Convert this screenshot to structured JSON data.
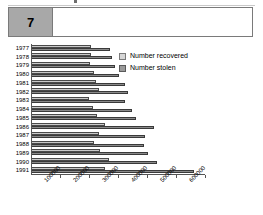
{
  "header": {
    "number": "7",
    "title": ""
  },
  "legend": {
    "position": "inside-top-right",
    "items": [
      {
        "label": "Number recovered",
        "key": "recovered",
        "color": "#d6d6d6"
      },
      {
        "label": "Number stolen",
        "key": "stolen",
        "color": "#9a9a9a"
      }
    ]
  },
  "chart_data": {
    "type": "bar",
    "orientation": "horizontal",
    "title": "",
    "xlabel": "",
    "ylabel": "",
    "grid": false,
    "xlim": [
      0,
      600000
    ],
    "xticks": [
      100000,
      200000,
      300000,
      400000,
      500000,
      600000
    ],
    "xtick_labels": [
      "100000",
      "200000",
      "300000",
      "400000",
      "500000",
      "600000"
    ],
    "categories": [
      "1977",
      "1978",
      "1979",
      "1980",
      "1981",
      "1982",
      "1983",
      "1984",
      "1985",
      "1986",
      "1987",
      "1988",
      "1989",
      "1990",
      "1991"
    ],
    "series": [
      {
        "name": "Number recovered",
        "color": "#c9c9c9",
        "values": [
          205000,
          205000,
          200000,
          215000,
          220000,
          230000,
          195000,
          210000,
          225000,
          250000,
          230000,
          215000,
          235000,
          265000,
          250000
        ]
      },
      {
        "name": "Number stolen",
        "color": "#8a8a8a",
        "values": [
          270000,
          275000,
          285000,
          300000,
          320000,
          330000,
          320000,
          345000,
          360000,
          420000,
          390000,
          385000,
          400000,
          430000,
          560000
        ]
      }
    ]
  }
}
